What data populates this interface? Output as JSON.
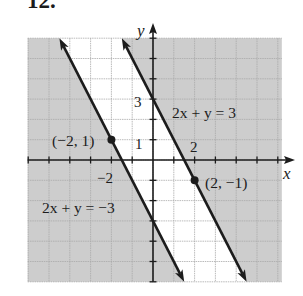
{
  "chart_data": {
    "type": "line",
    "title": "12.",
    "xlabel": "x",
    "ylabel": "y",
    "xlim": [
      -6,
      6
    ],
    "ylim": [
      -6,
      6
    ],
    "grid": true,
    "grid_step": 1,
    "legend": "none (lines labeled inline)",
    "x_tick_labels": [
      {
        "value": -2,
        "label": "−2"
      },
      {
        "value": 2,
        "label": "2"
      }
    ],
    "y_tick_labels": [
      {
        "value": 3,
        "label": "3"
      },
      {
        "value": 1,
        "label": "1"
      }
    ],
    "series": [
      {
        "name": "2x + y = −3",
        "equation": "y = −2x − 3",
        "slope": -2,
        "intercept": -3,
        "x": [
          -4.5,
          1.5
        ],
        "y": [
          6,
          -6
        ],
        "arrows": "both ends",
        "labeled_point": {
          "x": -2,
          "y": 1,
          "label": "(−2, 1)"
        }
      },
      {
        "name": "2x + y = 3",
        "equation": "y = −2x + 3",
        "slope": -2,
        "intercept": 3,
        "x": [
          -1.5,
          4.5
        ],
        "y": [
          6,
          -6
        ],
        "arrows": "both ends",
        "labeled_point": {
          "x": 2,
          "y": -1,
          "label": "(2, −1)"
        }
      }
    ],
    "shading": {
      "shaded_regions": [
        "2x + y ≤ −3 (left of lower line)",
        "2x + y ≥ 3 (right of upper line)"
      ],
      "unshaded_region": "−3 < 2x + y < 3 (between the lines)"
    }
  },
  "colors": {
    "shade": "#cdcdcd",
    "grid": "#a9a9a9",
    "ink": "#1c1c1c",
    "background": "#ffffff"
  }
}
